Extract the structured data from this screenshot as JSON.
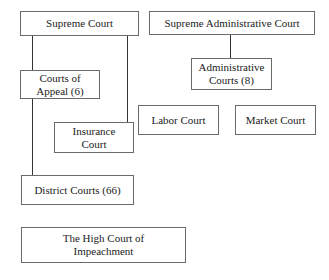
{
  "diagram": {
    "type": "org-chart",
    "nodes": [
      {
        "id": "supreme-court",
        "label": "Supreme Court"
      },
      {
        "id": "supreme-administrative-court",
        "label": "Supreme Administrative Court"
      },
      {
        "id": "administrative-courts",
        "label": "Administrative Courts (8)"
      },
      {
        "id": "courts-of-appeal",
        "label": "Courts of Appeal (6)"
      },
      {
        "id": "insurance-court",
        "label": "Insurance Court"
      },
      {
        "id": "labor-court",
        "label": "Labor Court"
      },
      {
        "id": "market-court",
        "label": "Market Court"
      },
      {
        "id": "district-courts",
        "label": "District Courts (66)"
      },
      {
        "id": "high-court-of-impeachment",
        "label": "The High Court of Impeachment"
      }
    ],
    "edges": [
      {
        "from": "supreme-court",
        "to": "courts-of-appeal"
      },
      {
        "from": "courts-of-appeal",
        "to": "district-courts"
      },
      {
        "from": "supreme-court",
        "to": "insurance-court"
      },
      {
        "from": "supreme-administrative-court",
        "to": "administrative-courts"
      }
    ],
    "lines": {
      "supreme_court_name": "Supreme Court",
      "supreme_admin_line1": "Supreme Administrative Court",
      "admin_courts_line1": "Administrative",
      "admin_courts_line2": "Courts (8)",
      "appeal_line1": "Courts of",
      "appeal_line2": "Appeal (6)",
      "insurance_line1": "Insurance",
      "insurance_line2": "Court",
      "labor": "Labor Court",
      "market": "Market Court",
      "district": "District Courts (66)",
      "impeachment_line1": "The High Court of",
      "impeachment_line2": "Impeachment"
    }
  }
}
